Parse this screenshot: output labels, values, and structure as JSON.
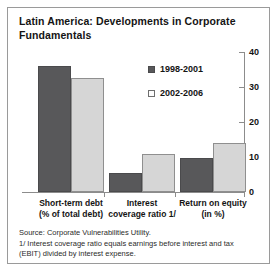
{
  "chart_data": {
    "type": "bar",
    "title": "Latin America: Developments in Corporate Fundamentals",
    "xlabel": "",
    "ylabel": "",
    "ylim": [
      0,
      40
    ],
    "yticks": [
      0,
      10,
      20,
      30,
      40
    ],
    "grid": false,
    "legend_position": "top-right",
    "categories": [
      "Short-term debt (% of total debt)",
      "Interest coverage ratio 1/",
      "Return on equity (in %)"
    ],
    "category_lines": [
      [
        "Short-term debt",
        "(% of total debt)"
      ],
      [
        "Interest",
        "coverage ratio 1/"
      ],
      [
        "Return on equity",
        "(in %)"
      ]
    ],
    "series": [
      {
        "name": "1998-2001",
        "color": "#58585a",
        "values": [
          36,
          5.4,
          9.7
        ]
      },
      {
        "name": "2002-2006",
        "color": "#d6d6d6",
        "values": [
          32.5,
          11,
          14
        ]
      }
    ],
    "annotations": [
      "Source: Corporate Vulnerabilities Utility.",
      "1/ Interest coverage ratio equals earnings before interest and tax (EBIT) divided by interest expense."
    ]
  },
  "legend": {
    "items": [
      {
        "label": "1998-2001"
      },
      {
        "label": "2002-2006"
      }
    ]
  },
  "axis": {
    "tick_labels": [
      "40",
      "30",
      "20",
      "10",
      "0"
    ]
  },
  "footnote": {
    "line1": "Source: Corporate Vulnerabilities Utility.",
    "line2": "1/ Interest coverage ratio equals earnings before interest and tax",
    "line3": "(EBIT) divided by interest expense."
  }
}
